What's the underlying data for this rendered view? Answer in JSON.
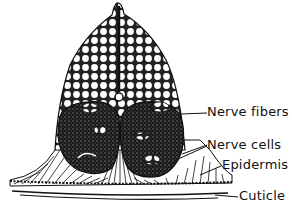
{
  "diagram": {
    "labels": [
      {
        "id": "nerve-fibers",
        "text": "Nerve fibers"
      },
      {
        "id": "nerve-cells",
        "text": "Nerve cells"
      },
      {
        "id": "epidermis",
        "text": "Epidermis"
      },
      {
        "id": "cuticle",
        "text": "Cuticle"
      }
    ]
  }
}
